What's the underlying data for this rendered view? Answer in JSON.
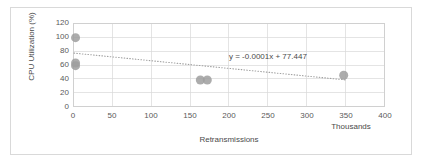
{
  "chart_data": {
    "type": "scatter",
    "title": "",
    "xlabel": "Retransmissions",
    "ylabel": "CPU Utilization (%)",
    "x_units_label": "Thousands",
    "xlim": [
      0,
      400
    ],
    "ylim": [
      0,
      120
    ],
    "xticks": [
      0,
      50,
      100,
      150,
      200,
      250,
      300,
      350,
      400
    ],
    "yticks": [
      0,
      20,
      40,
      60,
      80,
      100,
      120
    ],
    "xtick_labels": [
      "0",
      "50",
      "100",
      "150",
      "200",
      "250",
      "300",
      "350",
      "400"
    ],
    "ytick_labels": [
      "0",
      "20",
      "40",
      "60",
      "80",
      "100",
      "120"
    ],
    "grid": true,
    "grid_axes": "both",
    "legend": false,
    "legend_position": "none",
    "marker_color": "#9d9d9d",
    "marker_shape": "circle",
    "marker_size": 9,
    "series": [
      {
        "name": "CPU Utilization",
        "points": [
          {
            "x": 2,
            "y": 100
          },
          {
            "x": 2,
            "y": 63
          },
          {
            "x": 2,
            "y": 59
          },
          {
            "x": 163,
            "y": 38
          },
          {
            "x": 172,
            "y": 38
          },
          {
            "x": 348,
            "y": 45
          }
        ]
      }
    ],
    "trendline": {
      "type": "linear",
      "equation": "y = -0.0001x + 77.447",
      "slope": -0.0001,
      "intercept": 77.447,
      "x_start": 0,
      "x_end": 352,
      "y_start": 77.4,
      "y_end": 38.0,
      "style": "dotted",
      "color": "#a0a0a0"
    },
    "annotations": [
      {
        "text": "y = -0.0001x + 77.447",
        "x": 230,
        "y": 88
      }
    ]
  },
  "chart": {
    "border_color": "#d9d9d9",
    "plot_border_color": "#d0d0d0",
    "gridline_color": "#d8d8d8",
    "background": "#ffffff"
  }
}
